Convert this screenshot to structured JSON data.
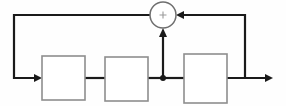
{
  "diagram": {
    "type": "signal-flow-block-diagram",
    "background_color": "#fefefe",
    "wire_color": "#1a1a1a",
    "block_border_color": "#8e8e8e",
    "block_fill_color": "#ffffff",
    "summing_junction": {
      "name": "summing-junction",
      "symbol": "+",
      "center_x": 163,
      "center_y": 15,
      "radius": 13,
      "inputs": [
        "from-right-feedback-path",
        "from-forward-path-tap"
      ],
      "outputs": [
        "to-left-feedback-path"
      ]
    },
    "blocks": [
      {
        "name": "block-1",
        "label": "",
        "x": 42,
        "y": 56,
        "width": 43,
        "height": 44
      },
      {
        "name": "block-2",
        "label": "",
        "x": 105,
        "y": 57,
        "width": 43,
        "height": 44
      },
      {
        "name": "block-3",
        "label": "",
        "x": 184,
        "y": 54,
        "width": 43,
        "height": 49
      }
    ],
    "nodes": [
      {
        "name": "forward-path-tap-node",
        "x": 163,
        "y": 78,
        "radius": 3
      }
    ],
    "wires": [
      {
        "name": "left-feedback-wire",
        "path": "M 163 15 L 14 15 L 14 78 L 42 78",
        "arrow": "right",
        "arrow_x": 42,
        "arrow_y": 78
      },
      {
        "name": "block1-to-block2-wire",
        "path": "M 85 78 L 105 78",
        "arrow": "none"
      },
      {
        "name": "block2-to-tap-wire",
        "path": "M 148 78 L 163 78",
        "arrow": "none"
      },
      {
        "name": "tap-to-block3-wire",
        "path": "M 163 78 L 184 78",
        "arrow": "none"
      },
      {
        "name": "tap-to-sum-wire",
        "path": "M 163 78 L 163 30",
        "arrow": "up",
        "arrow_x": 163,
        "arrow_y": 29
      },
      {
        "name": "block3-to-output-wire",
        "path": "M 227 78 L 272 78",
        "arrow": "right",
        "arrow_x": 272,
        "arrow_y": 78
      },
      {
        "name": "right-feedback-wire",
        "path": "M 245 78 L 245 15 L 177 15",
        "arrow": "left",
        "arrow_x": 177,
        "arrow_y": 15
      }
    ]
  }
}
